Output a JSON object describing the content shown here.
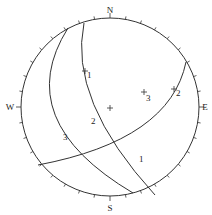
{
  "diagram": {
    "type": "stereonet",
    "center": [
      110,
      107
    ],
    "radius": 89,
    "line_color": "#333333",
    "directions": [
      {
        "label": "N",
        "x": 110,
        "y": 13
      },
      {
        "label": "E",
        "x": 205,
        "y": 110
      },
      {
        "label": "S",
        "x": 110,
        "y": 211
      },
      {
        "label": "W",
        "x": 10,
        "y": 110
      }
    ],
    "great_circles": [
      {
        "label": "1",
        "path": "M 84 23 Q 68 100 155 195",
        "label_x": 139,
        "label_y": 162
      },
      {
        "label": "2",
        "path": "M 186 62 Q 170 140 38 165",
        "label_x": 91,
        "label_y": 124
      },
      {
        "label": "3",
        "path": "M 68 28 Q 10 120 133 193",
        "label_x": 63,
        "label_y": 140
      }
    ],
    "poles": [
      {
        "label": "1",
        "x": 85,
        "y": 71,
        "label_x": 87,
        "label_y": 78
      },
      {
        "label": "2",
        "x": 174,
        "y": 89,
        "label_x": 176,
        "label_y": 96
      },
      {
        "label": "3",
        "x": 144,
        "y": 92,
        "label_x": 146,
        "label_y": 101
      },
      {
        "label": "",
        "x": 110,
        "y": 108,
        "label_x": 0,
        "label_y": 0
      }
    ]
  }
}
